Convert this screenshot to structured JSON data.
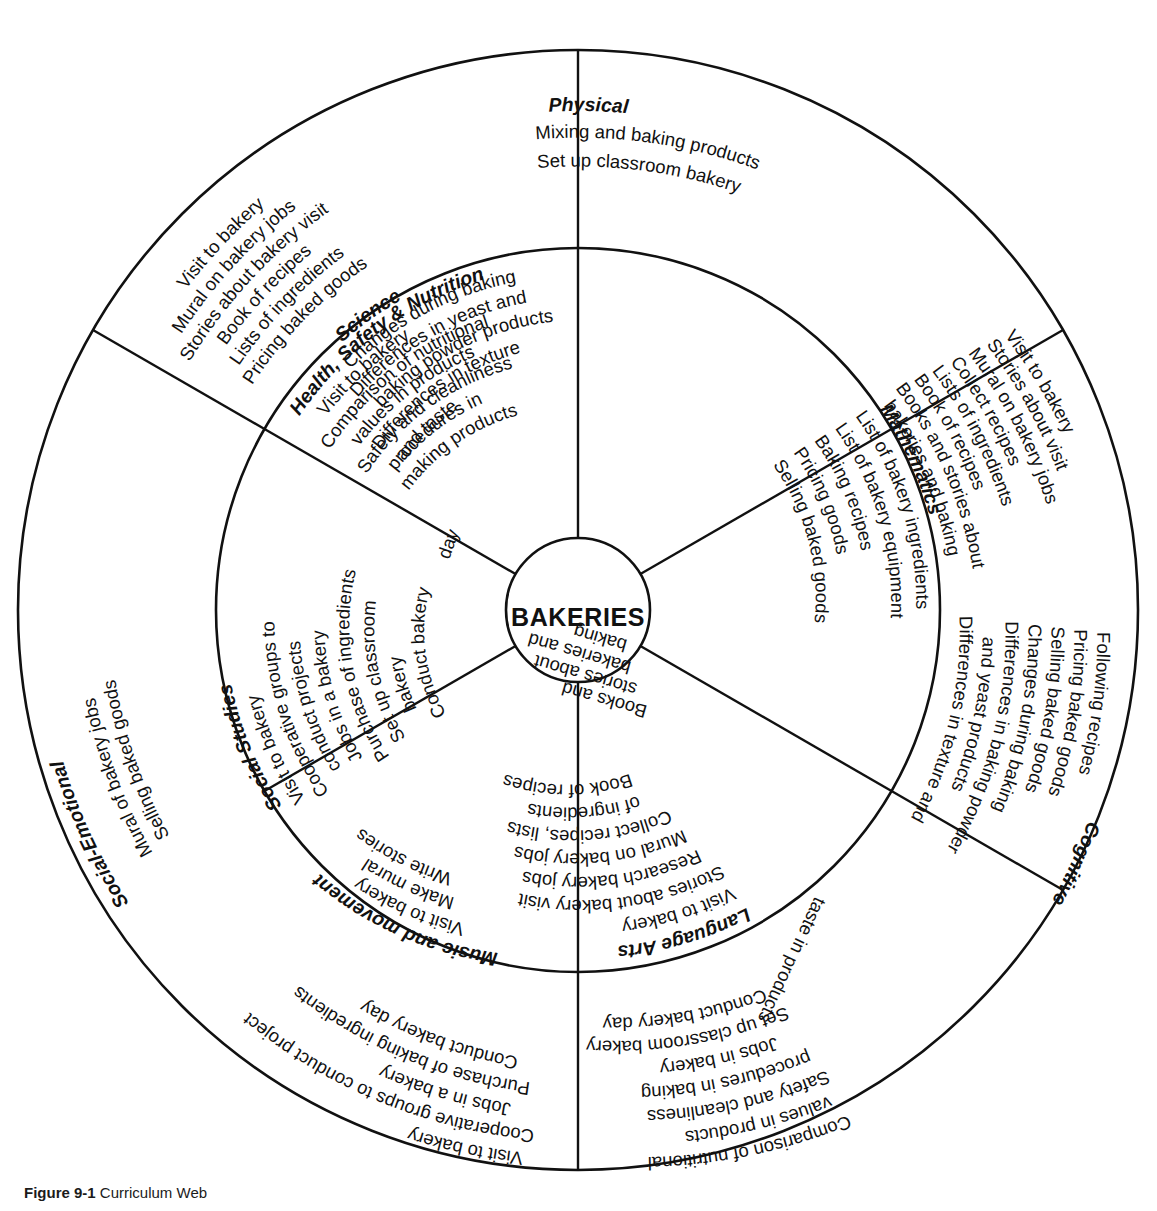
{
  "diagram": {
    "center_label": "BAKERIES",
    "type": "curriculum-web",
    "geometry": {
      "center_x": 578,
      "center_y": 610,
      "core_radius": 72,
      "inner_ring_radius": 362,
      "outer_ring_radius": 560
    },
    "colors": {
      "stroke": "#111111",
      "background": "#ffffff",
      "text": "#111111"
    }
  },
  "inner_ring": {
    "sectors": [
      {
        "id": "science",
        "heading": "Science",
        "items": [
          "Changes during baking",
          "Differences in yeast and",
          "baking powder products",
          "Differences in texture",
          "and taste"
        ]
      },
      {
        "id": "mathematics",
        "heading": "Mathematics",
        "items": [
          "List of bakery ingredients",
          "List of bakery equipment",
          "Baking recipes",
          "Pricing goods",
          "Selling baked goods"
        ]
      },
      {
        "id": "language-arts",
        "heading": "Language Arts",
        "items": [
          "Visit to bakery",
          "Stories about bakery visit",
          "Research bakery jobs",
          "Mural on bakery jobs",
          "Collect recipes, lists",
          "of ingredients",
          "Book of recipes",
          "Books and",
          "stories about",
          "bakeries and",
          "baking"
        ]
      },
      {
        "id": "music-and-movement",
        "heading": "Music and movement",
        "items": [
          "Visit to bakery",
          "Make mural",
          "Write stories"
        ]
      },
      {
        "id": "social-studies",
        "heading": "Social Studies",
        "items": [
          "Visit to bakery",
          "Cooperative groups to",
          "conduct projects",
          "Jobs in a bakery",
          "Purchase of ingredients",
          "Set up classroom",
          "bakery",
          "Conduct bakery",
          "day"
        ]
      },
      {
        "id": "health-safety-nutrition",
        "heading": "Health, Safety & Nutrition",
        "items": [
          "Visit to bakery",
          "Comparison of nutritional",
          "values in products",
          "Safety and cleanliness",
          "procedures in",
          "making products"
        ]
      }
    ]
  },
  "outer_ring": {
    "sectors": [
      {
        "id": "physical",
        "heading": "Physical",
        "items": [
          "Mixing and baking products",
          "Set up classroom bakery"
        ]
      },
      {
        "id": "cognitive",
        "heading": "Cognitive",
        "items": [
          "Following recipes",
          "Pricing baked goods",
          "Selling baked goods",
          "Changes during baking",
          "Differences in baking powder",
          "and yeast products",
          "Differences in texture and",
          "taste in products"
        ]
      },
      {
        "id": "cognitive-upper",
        "heading": "",
        "items": [
          "Visit to bakery",
          "Stories about visit",
          "Mural on bakery jobs",
          "Collect recipes",
          "Lists of ingredients",
          "Book of recipes",
          "Books and stories about",
          "bakeries and baking"
        ]
      },
      {
        "id": "social-emotional",
        "heading": "Social-Emotional",
        "items": [
          "Mural of bakery jobs",
          "Selling baked goods"
        ]
      },
      {
        "id": "social-emotional-upper",
        "heading": "",
        "items": [
          "Visit to bakery",
          "Mural on bakery jobs",
          "Stories about bakery visit",
          "Book of recipes",
          "Lists of ingredients",
          "Pricing baked goods"
        ]
      },
      {
        "id": "social-emotional-lower",
        "heading": "",
        "items": [
          "Visit to bakery",
          "Cooperative groups to conduct project",
          "Jobs in a bakery",
          "Purchase of baking ingredients",
          "Conduct bakery day"
        ]
      },
      {
        "id": "cognitive-lower",
        "heading": "",
        "items": [
          "Comparison of nutritional",
          "values in products",
          "Safety and cleanliness",
          "procedures in baking",
          "Jobs in bakery",
          "Set up classroom bakery",
          "Conduct bakery day"
        ]
      }
    ]
  },
  "caption": {
    "label": "Figure 9-1",
    "text": "Curriculum Web"
  }
}
